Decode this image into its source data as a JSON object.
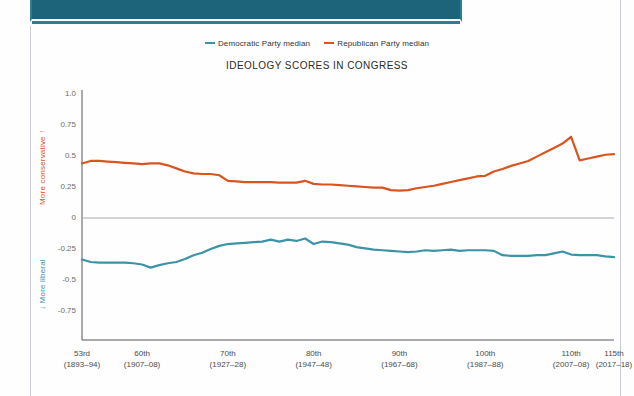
{
  "header": {
    "band_color": "#1d6379",
    "band_accent": "#2e7f95"
  },
  "legend": {
    "items": [
      {
        "label": "Democratic Party median",
        "color": "#3b93a8",
        "icon": "line-swatch-icon"
      },
      {
        "label": "Republican Party median",
        "color": "#d9541e",
        "icon": "line-swatch-icon"
      }
    ]
  },
  "axis": {
    "y_top_label": "More conservative ↑",
    "y_bottom_label": "↓ More liberal",
    "y_top_color": "#d9541e",
    "y_bottom_color": "#3b93a8"
  },
  "chart_data": {
    "type": "line",
    "title": "IDEOLOGY SCORES IN CONGRESS",
    "xlabel": "",
    "ylabel": "",
    "ylim": [
      -0.875,
      1.0
    ],
    "yticks": [
      1.0,
      0.75,
      0.5,
      0.25,
      0,
      -0.25,
      -0.5,
      -0.75
    ],
    "ytick_labels": [
      "1.0",
      "0.75",
      "0.5",
      "0.25",
      "0",
      "-0.25",
      "-0.5",
      "-0.75"
    ],
    "grid": false,
    "zero_line": true,
    "legend_position": "top",
    "x": [
      53,
      54,
      55,
      56,
      57,
      58,
      59,
      60,
      61,
      62,
      63,
      64,
      65,
      66,
      67,
      68,
      69,
      70,
      71,
      72,
      73,
      74,
      75,
      76,
      77,
      78,
      79,
      80,
      81,
      82,
      83,
      84,
      85,
      86,
      87,
      88,
      89,
      90,
      91,
      92,
      93,
      94,
      95,
      96,
      97,
      98,
      99,
      100,
      101,
      102,
      103,
      104,
      105,
      106,
      107,
      108,
      109,
      110,
      111,
      112,
      113,
      114,
      115
    ],
    "xticks": [
      53,
      60,
      70,
      80,
      90,
      100,
      110,
      115
    ],
    "xtick_labels": [
      {
        "congress": "53rd",
        "years": "(1893–94)"
      },
      {
        "congress": "60th",
        "years": "(1907–08)"
      },
      {
        "congress": "70th",
        "years": "(1927–28)"
      },
      {
        "congress": "80th",
        "years": "(1947–48)"
      },
      {
        "congress": "90th",
        "years": "(1967–68)"
      },
      {
        "congress": "100th",
        "years": "(1987–88)"
      },
      {
        "congress": "110th",
        "years": "(2007–08)"
      },
      {
        "congress": "115th",
        "years": "(2017–18)"
      }
    ],
    "series": [
      {
        "name": "Republican Party median",
        "color": "#d9541e",
        "values": [
          0.44,
          0.46,
          0.46,
          0.455,
          0.45,
          0.445,
          0.44,
          0.435,
          0.44,
          0.44,
          0.425,
          0.4,
          0.375,
          0.36,
          0.355,
          0.355,
          0.345,
          0.3,
          0.295,
          0.29,
          0.29,
          0.29,
          0.29,
          0.285,
          0.285,
          0.285,
          0.3,
          0.275,
          0.27,
          0.27,
          0.265,
          0.26,
          0.255,
          0.25,
          0.245,
          0.245,
          0.225,
          0.22,
          0.225,
          0.24,
          0.25,
          0.26,
          0.275,
          0.29,
          0.305,
          0.32,
          0.335,
          0.34,
          0.375,
          0.395,
          0.42,
          0.44,
          0.46,
          0.495,
          0.53,
          0.565,
          0.6,
          0.655,
          0.465,
          0.48,
          0.495,
          0.51,
          0.515
        ]
      },
      {
        "name": "Democratic Party median",
        "color": "#3b93a8",
        "values": [
          -0.335,
          -0.355,
          -0.36,
          -0.36,
          -0.36,
          -0.36,
          -0.365,
          -0.375,
          -0.4,
          -0.38,
          -0.365,
          -0.355,
          -0.33,
          -0.3,
          -0.28,
          -0.25,
          -0.225,
          -0.21,
          -0.205,
          -0.2,
          -0.195,
          -0.19,
          -0.175,
          -0.19,
          -0.175,
          -0.185,
          -0.165,
          -0.21,
          -0.19,
          -0.195,
          -0.205,
          -0.215,
          -0.235,
          -0.245,
          -0.255,
          -0.26,
          -0.265,
          -0.27,
          -0.275,
          -0.27,
          -0.26,
          -0.265,
          -0.26,
          -0.255,
          -0.265,
          -0.26,
          -0.26,
          -0.26,
          -0.265,
          -0.3,
          -0.305,
          -0.305,
          -0.305,
          -0.3,
          -0.3,
          -0.285,
          -0.27,
          -0.295,
          -0.3,
          -0.3,
          -0.3,
          -0.31,
          -0.315
        ]
      }
    ]
  }
}
